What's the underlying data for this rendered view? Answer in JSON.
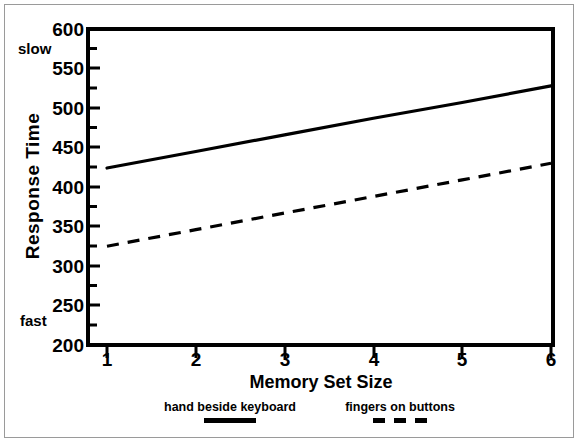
{
  "chart_data": {
    "type": "line",
    "title": "",
    "xlabel": "Memory Set Size",
    "ylabel": "Response Time",
    "x": [
      1,
      2,
      3,
      4,
      5,
      6
    ],
    "xticks": [
      "1",
      "2",
      "3",
      "4",
      "5",
      "6"
    ],
    "xlim": [
      1,
      6
    ],
    "yticks": [
      "600",
      "550",
      "500",
      "450",
      "400",
      "350",
      "300",
      "250",
      "200"
    ],
    "ylim": [
      200,
      600
    ],
    "minor_ticks": true,
    "grid": false,
    "legend_position": "below-axes",
    "annotations": [
      {
        "text": "slow",
        "position": "top-left-outside-y-axis"
      },
      {
        "text": "fast",
        "position": "bottom-left-outside-y-axis"
      }
    ],
    "series": [
      {
        "name": "hand beside keyboard",
        "style": "solid",
        "color": "#000000",
        "values": [
          424,
          445,
          466,
          487,
          507,
          528
        ]
      },
      {
        "name": "fingers on buttons",
        "style": "dashed",
        "color": "#000000",
        "values": [
          325,
          346,
          367,
          388,
          409,
          430
        ]
      }
    ]
  },
  "legend": {
    "entries": [
      {
        "label": "hand beside keyboard",
        "style": "solid"
      },
      {
        "label": "fingers on buttons",
        "style": "dashed"
      }
    ]
  },
  "colors": {
    "background": "#ffffff",
    "axis": "#000000",
    "frame": "#9a9a9a",
    "series": "#000000"
  }
}
